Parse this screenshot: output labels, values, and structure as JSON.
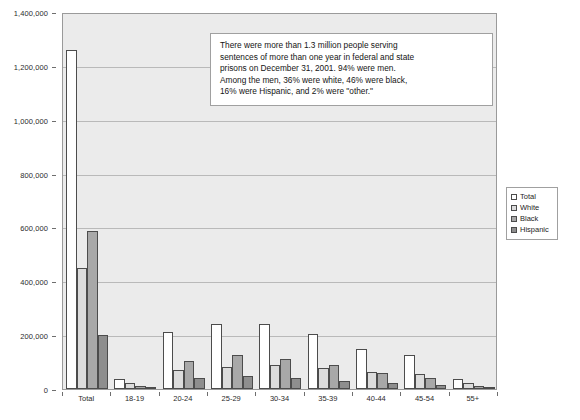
{
  "chart_data": {
    "type": "bar",
    "title": "",
    "xlabel": "",
    "ylabel": "",
    "ylim": [
      0,
      1400000
    ],
    "grid": true,
    "legend_position": "right",
    "categories": [
      "Total",
      "18-19",
      "20-24",
      "25-29",
      "30-34",
      "35-39",
      "40-44",
      "45-54",
      "55+"
    ],
    "ytick_labels": [
      "1,400,000",
      "1,200,000",
      "1,000,000",
      "800,000",
      "600,000",
      "400,000",
      "200,000",
      "0"
    ],
    "ytick_values": [
      1400000,
      1200000,
      1000000,
      800000,
      600000,
      400000,
      200000,
      0
    ],
    "series": [
      {
        "name": "Total",
        "color": "#ffffff",
        "values": [
          1260000,
          38000,
          212000,
          240000,
          240000,
          205000,
          148000,
          128000,
          38000
        ]
      },
      {
        "name": "White",
        "color": "#dcdcdc",
        "values": [
          450000,
          22000,
          72000,
          82000,
          88000,
          78000,
          62000,
          55000,
          22000
        ]
      },
      {
        "name": "Black",
        "color": "#a8a8a8",
        "values": [
          585000,
          10000,
          105000,
          125000,
          112000,
          88000,
          58000,
          42000,
          13000
        ]
      },
      {
        "name": "Hispanic",
        "color": "#8e8e8e",
        "values": [
          200000,
          4000,
          42000,
          50000,
          42000,
          30000,
          22000,
          14000,
          6000
        ]
      }
    ],
    "annotation": {
      "lines": [
        "There were more than 1.3 million people serving",
        "sentences of more than one year in federal and state",
        "prisons on December 31, 2001. 94% were men.",
        "Among the men, 36% were white, 46% were black,",
        "16% were Hispanic, and 2% were \"other.\""
      ]
    }
  }
}
